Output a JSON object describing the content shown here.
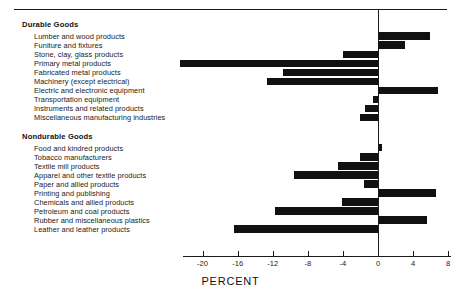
{
  "chart_data": {
    "type": "bar",
    "orientation": "horizontal",
    "title": "",
    "xlabel": "PERCENT",
    "ylabel": "",
    "xlim": [
      -23.5,
      8.5
    ],
    "xticks": [
      -20,
      -16,
      -12,
      -8,
      -4,
      0,
      4,
      8
    ],
    "xtick_labels": [
      "-20",
      "-16",
      "-12",
      "-8",
      "-4",
      "0",
      "4",
      "8"
    ],
    "grid": false,
    "legend": "none",
    "zero_line": true,
    "groups": [
      {
        "name": "Durable Goods",
        "categories": [
          "Lumber and wood products",
          "Funiture and fixtures",
          "Stone, clay, glass products",
          "Primary metal products",
          "Fabricated metal products",
          "Machinery (except electrical)",
          "Electric and electronic equipment",
          "Transportation equipment",
          "Instruments and related products",
          "Miscellaneous manufacturing industries"
        ],
        "values": [
          5.9,
          3.1,
          -4.0,
          -22.6,
          -10.8,
          -12.6,
          6.8,
          -0.6,
          -1.5,
          -2.1
        ]
      },
      {
        "name": "Nondurable Goods",
        "categories": [
          "Food and kindred products",
          "Tobacco manufacturers",
          "Textile mill products",
          "Apparel and other textile products",
          "Paper and allied products",
          "Printing and publishing",
          "Chemicals and allied products",
          "Petroleum and coal products",
          "Rubber and miscellaneous plastics",
          "Leather and leather products"
        ],
        "values": [
          0.4,
          -2.0,
          -4.6,
          -9.6,
          -1.6,
          6.6,
          -4.1,
          -11.7,
          5.6,
          -16.4
        ]
      }
    ]
  },
  "axis": {
    "title": "PERCENT"
  }
}
